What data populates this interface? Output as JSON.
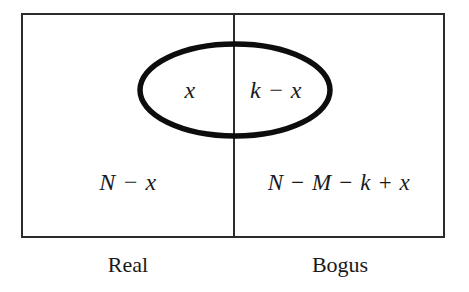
{
  "figure": {
    "background_color": "#ffffff",
    "stroke_color": "#2b2b2b",
    "ellipse_stroke_color": "#0d0d0d",
    "text_color": "#1a1a1a"
  },
  "outer_box": {
    "name": "population-rectangle",
    "x": 22,
    "y": 14,
    "width": 422,
    "height": 223
  },
  "divider": {
    "name": "real-bogus-divider",
    "x": 234,
    "y_top": 14,
    "y_bottom": 237
  },
  "ellipse": {
    "name": "selected-set-ellipse",
    "cx": 235,
    "cy": 90,
    "rx": 95,
    "ry": 46
  },
  "regions": {
    "ellipse_left": {
      "label": "x",
      "cx": 190,
      "cy": 98
    },
    "ellipse_right": {
      "label": "k − x",
      "cx": 276,
      "cy": 98
    },
    "outside_left": {
      "label": "N − x",
      "cx": 128,
      "cy": 190
    },
    "outside_right": {
      "label": "N − M − k + x",
      "cx": 339,
      "cy": 190
    }
  },
  "column_labels": {
    "left": {
      "label": "Real",
      "cx": 128,
      "cy": 272
    },
    "right": {
      "label": "Bogus",
      "cx": 340,
      "cy": 272
    }
  }
}
